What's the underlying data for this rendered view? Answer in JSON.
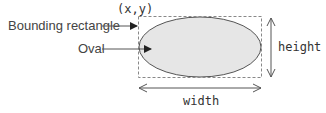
{
  "diagram": {
    "labels": {
      "origin": "(x,y)",
      "bounding_rectangle": "Bounding rectangle",
      "oval": "Oval",
      "height": "height",
      "width": "width"
    },
    "colors": {
      "oval_fill": "#e6e6e6",
      "oval_stroke": "#555555",
      "rect_stroke": "#888888",
      "arrow": "#555555",
      "text": "#444444"
    }
  }
}
